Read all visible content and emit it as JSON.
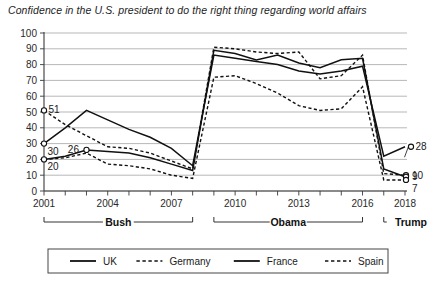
{
  "chart_data": {
    "type": "line",
    "title": "Confidence in the U.S. president to do the right thing regarding world affairs",
    "xlabel": "",
    "ylabel": "",
    "ylim": [
      0,
      100
    ],
    "ytick_step": 10,
    "ytick_labels": [
      "0",
      "10",
      "20",
      "30",
      "40",
      "50",
      "60",
      "70",
      "80",
      "90",
      "100"
    ],
    "xlim": [
      2001,
      2018
    ],
    "xtick_labels": [
      "2001",
      "2004",
      "2007",
      "2010",
      "2013",
      "2016",
      "2018"
    ],
    "xticks_all_years": [
      2001,
      2002,
      2003,
      2004,
      2005,
      2006,
      2007,
      2008,
      2009,
      2010,
      2011,
      2012,
      2013,
      2014,
      2015,
      2016,
      2017,
      2018
    ],
    "grid": "horizontal",
    "legend_position": "bottom",
    "x": [
      2001,
      2002,
      2003,
      2004,
      2005,
      2006,
      2007,
      2008,
      2009,
      2010,
      2011,
      2012,
      2013,
      2014,
      2015,
      2016,
      2017,
      2018
    ],
    "series": [
      {
        "name": "UK",
        "style": "solid",
        "values": [
          30,
          40,
          51,
          45,
          39,
          34,
          27,
          16,
          86,
          84,
          82,
          80,
          76,
          74,
          76,
          79,
          22,
          28
        ]
      },
      {
        "name": "Germany",
        "style": "dashed",
        "values": [
          51,
          42,
          35,
          28,
          27,
          24,
          19,
          14,
          91,
          90,
          88,
          87,
          88,
          71,
          73,
          86,
          11,
          10
        ]
      },
      {
        "name": "France",
        "style": "solid",
        "values": [
          20,
          22,
          26,
          25,
          24,
          21,
          17,
          13,
          89,
          87,
          83,
          86,
          81,
          78,
          83,
          84,
          14,
          9
        ]
      },
      {
        "name": "Spain",
        "style": "dashed",
        "values": [
          20,
          21,
          24,
          17,
          16,
          14,
          10,
          8,
          72,
          73,
          68,
          62,
          54,
          51,
          52,
          66,
          7,
          7
        ]
      }
    ],
    "point_labels": [
      {
        "series": "Germany",
        "x": 2001,
        "value": 51,
        "text": "51"
      },
      {
        "series": "UK",
        "x": 2001,
        "value": 30,
        "text": "30"
      },
      {
        "series": "France",
        "x": 2001,
        "value": 20,
        "text": "20"
      },
      {
        "series": "France",
        "x": 2003,
        "value": 26,
        "text": "26"
      },
      {
        "series": "UK",
        "x": 2018,
        "value": 28,
        "text": "28"
      },
      {
        "series": "Germany",
        "x": 2018,
        "value": 10,
        "text": "10"
      },
      {
        "series": "France",
        "x": 2018,
        "value": 9,
        "text": "9"
      },
      {
        "series": "Spain",
        "x": 2018,
        "value": 7,
        "text": "7"
      }
    ],
    "eras": [
      {
        "label": "Bush",
        "start": 2001,
        "end": 2008
      },
      {
        "label": "Obama",
        "start": 2009,
        "end": 2016
      },
      {
        "label": "Trump",
        "start": 2017,
        "end": 2018
      }
    ],
    "legend": [
      {
        "label": "UK",
        "style": "solid"
      },
      {
        "label": "Germany",
        "style": "dashed"
      },
      {
        "label": "France",
        "style": "solid"
      },
      {
        "label": "Spain",
        "style": "dashed"
      }
    ]
  }
}
